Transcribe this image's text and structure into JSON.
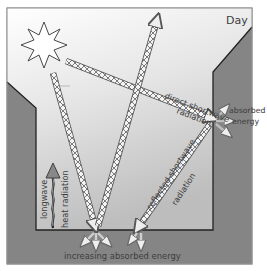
{
  "diagram": {
    "title": "Day",
    "labels": {
      "direct_line1": "direct shortwave",
      "direct_line2": "radiation",
      "reflected_line1": "reflected shortwave",
      "reflected_line2": "radiation",
      "absorbed_line1": "absorbed",
      "absorbed_line2": "energy",
      "longwave": "longwave",
      "heat": "heat radiation",
      "ground": "increasing absorbed energy"
    },
    "icons": {
      "sun": "sun-icon"
    },
    "colors": {
      "building": "#7a7a7a",
      "border": "#2a2a2a",
      "sky_top": "#ffffff",
      "sky_bottom": "#c4c4c4",
      "ray_fill": "#9a9a9a",
      "longwave_arrow": "#777777"
    }
  }
}
